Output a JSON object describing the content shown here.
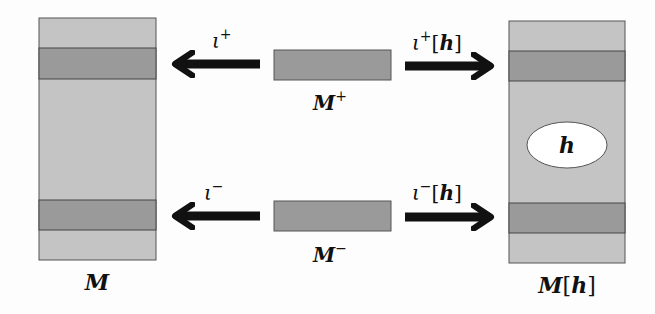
{
  "diagram": {
    "colors": {
      "light_fill": "#c4c4c4",
      "dark_band": "#9a9a9a",
      "outline": "#555555",
      "arrow": "#111111",
      "ellipse_fill": "#ffffff"
    },
    "nodes": {
      "M": {
        "label": "M"
      },
      "M_plus": {
        "label": "M",
        "sup": "+"
      },
      "M_minus": {
        "label": "M",
        "sup": "−"
      },
      "M_h": {
        "label": "M",
        "bracket_open": "[",
        "arg": "h",
        "bracket_close": "]"
      },
      "hole": {
        "label": "h"
      }
    },
    "arrows": {
      "iota_plus": {
        "symbol": "ι",
        "sup": "+"
      },
      "iota_minus": {
        "symbol": "ι",
        "sup": "−"
      },
      "iota_plus_h": {
        "symbol": "ι",
        "sup": "+",
        "bracket_open": "[",
        "arg": "h",
        "bracket_close": "]"
      },
      "iota_minus_h": {
        "symbol": "ι",
        "sup": "−",
        "bracket_open": "[",
        "arg": "h",
        "bracket_close": "]"
      }
    }
  }
}
